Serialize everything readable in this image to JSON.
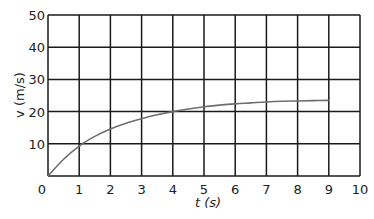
{
  "chart_data": {
    "type": "line",
    "title": "",
    "xlabel": "t (s)",
    "ylabel": "v (m/s)",
    "xlim": [
      0,
      10
    ],
    "ylim": [
      0,
      50
    ],
    "grid": true,
    "x_ticks": [
      0,
      1,
      2,
      3,
      4,
      5,
      6,
      7,
      8,
      9,
      10
    ],
    "y_ticks": [
      10,
      20,
      30,
      40,
      50
    ],
    "origin_label": "0",
    "series": [
      {
        "name": "velocity",
        "color": "#6e6e6e",
        "x": [
          0,
          0.5,
          1,
          1.5,
          2,
          2.5,
          3,
          3.5,
          4,
          4.5,
          5,
          5.5,
          6,
          6.5,
          7,
          7.5,
          8,
          8.5,
          9
        ],
        "values": [
          0,
          5.2,
          9.3,
          12.3,
          14.6,
          16.4,
          17.8,
          19.0,
          20.0,
          20.8,
          21.5,
          22.0,
          22.4,
          22.7,
          23.0,
          23.2,
          23.3,
          23.4,
          23.5
        ]
      }
    ]
  },
  "colors": {
    "grid": "#1a1a1a",
    "curve": "#6e6e6e",
    "text": "#222222"
  }
}
